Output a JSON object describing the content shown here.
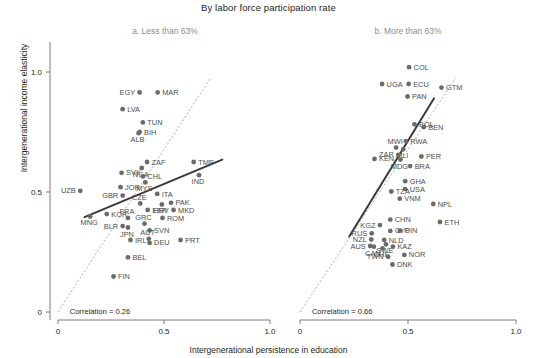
{
  "chart_data": {
    "type": "scatter",
    "title": "By labor force participation rate",
    "xlabel": "Intergenerational persistence in education",
    "ylabel": "Intergenerational income elasticity",
    "xlim": [
      0,
      1.0
    ],
    "ylim": [
      0,
      1.15
    ],
    "xticks": [
      "0",
      "0.5",
      "1.0"
    ],
    "xtick_values": [
      0,
      0.5,
      1.0
    ],
    "yticks": [
      "0",
      "0.5",
      "1.0"
    ],
    "ytick_values": [
      0,
      0.5,
      1.0
    ],
    "grid": false,
    "legend": "none",
    "reference_line": "45-degree dashed identity line",
    "panels": [
      {
        "key": "a",
        "title": "a. Less than 63%",
        "annotation": "Correlation = 0.26",
        "fit_line": {
          "x0": 0.125,
          "y0": 0.395,
          "x1": 0.775,
          "y1": 0.635
        },
        "points": [
          {
            "label": "UZB",
            "x": 0.105,
            "y": 0.505,
            "lpos": "left"
          },
          {
            "label": "LVA",
            "x": 0.305,
            "y": 0.845,
            "lpos": "right"
          },
          {
            "label": "EGY",
            "x": 0.385,
            "y": 0.915,
            "lpos": "left"
          },
          {
            "label": "MAR",
            "x": 0.47,
            "y": 0.915,
            "lpos": "right"
          },
          {
            "label": "TUN",
            "x": 0.4,
            "y": 0.79,
            "lpos": "right"
          },
          {
            "label": "BIH",
            "x": 0.385,
            "y": 0.75,
            "lpos": "right"
          },
          {
            "label": "ALB",
            "x": 0.38,
            "y": 0.745,
            "lpos": "below"
          },
          {
            "label": "ZAF",
            "x": 0.42,
            "y": 0.625,
            "lpos": "right"
          },
          {
            "label": "NGA",
            "x": 0.395,
            "y": 0.6,
            "lpos": "below"
          },
          {
            "label": "TMP",
            "x": 0.64,
            "y": 0.625,
            "lpos": "right"
          },
          {
            "label": "SVK",
            "x": 0.3,
            "y": 0.58,
            "lpos": "right"
          },
          {
            "label": "CHL",
            "x": 0.4,
            "y": 0.565,
            "lpos": "right"
          },
          {
            "label": "MYS",
            "x": 0.412,
            "y": 0.54,
            "lpos": "below"
          },
          {
            "label": "IND",
            "x": 0.665,
            "y": 0.57,
            "lpos": "below"
          },
          {
            "label": "JOR",
            "x": 0.295,
            "y": 0.52,
            "lpos": "right"
          },
          {
            "label": "GBR",
            "x": 0.305,
            "y": 0.485,
            "lpos": "left"
          },
          {
            "label": "ITA",
            "x": 0.468,
            "y": 0.492,
            "lpos": "right"
          },
          {
            "label": "CZE",
            "x": 0.388,
            "y": 0.452,
            "lpos": "above"
          },
          {
            "label": "HRV",
            "x": 0.49,
            "y": 0.448,
            "lpos": "below"
          },
          {
            "label": "PAK",
            "x": 0.533,
            "y": 0.455,
            "lpos": "right"
          },
          {
            "label": "MKD",
            "x": 0.545,
            "y": 0.425,
            "lpos": "right"
          },
          {
            "label": "ESP",
            "x": 0.423,
            "y": 0.425,
            "lpos": "right"
          },
          {
            "label": "KOR",
            "x": 0.23,
            "y": 0.408,
            "lpos": "right"
          },
          {
            "label": "MNG",
            "x": 0.152,
            "y": 0.398,
            "lpos": "below"
          },
          {
            "label": "FRA",
            "x": 0.33,
            "y": 0.392,
            "lpos": "above"
          },
          {
            "label": "ROM",
            "x": 0.493,
            "y": 0.392,
            "lpos": "right"
          },
          {
            "label": "BLR",
            "x": 0.305,
            "y": 0.358,
            "lpos": "left"
          },
          {
            "label": "JPN",
            "x": 0.33,
            "y": 0.352,
            "lpos": "below"
          },
          {
            "label": "GRC",
            "x": 0.408,
            "y": 0.368,
            "lpos": "above"
          },
          {
            "label": "SVN",
            "x": 0.432,
            "y": 0.34,
            "lpos": "right"
          },
          {
            "label": "AUT",
            "x": 0.428,
            "y": 0.305,
            "lpos": "above"
          },
          {
            "label": "DEU",
            "x": 0.432,
            "y": 0.288,
            "lpos": "right"
          },
          {
            "label": "IRL",
            "x": 0.342,
            "y": 0.3,
            "lpos": "right"
          },
          {
            "label": "PRT",
            "x": 0.578,
            "y": 0.3,
            "lpos": "right"
          },
          {
            "label": "BEL",
            "x": 0.33,
            "y": 0.228,
            "lpos": "right"
          },
          {
            "label": "FIN",
            "x": 0.262,
            "y": 0.148,
            "lpos": "right"
          }
        ]
      },
      {
        "key": "b",
        "title": "b. More than 63%",
        "annotation": "Correlation = 0.66",
        "fit_line": {
          "x0": 0.228,
          "y0": 0.315,
          "x1": 0.62,
          "y1": 0.89
        },
        "points": [
          {
            "label": "COL",
            "x": 0.505,
            "y": 1.02,
            "lpos": "right"
          },
          {
            "label": "UGA",
            "x": 0.38,
            "y": 0.95,
            "lpos": "right"
          },
          {
            "label": "ECU",
            "x": 0.503,
            "y": 0.95,
            "lpos": "right"
          },
          {
            "label": "GTM",
            "x": 0.655,
            "y": 0.935,
            "lpos": "right"
          },
          {
            "label": "PAN",
            "x": 0.498,
            "y": 0.898,
            "lpos": "right"
          },
          {
            "label": "BOL",
            "x": 0.53,
            "y": 0.782,
            "lpos": "right"
          },
          {
            "label": "BEN",
            "x": 0.573,
            "y": 0.77,
            "lpos": "right"
          },
          {
            "label": "RWA",
            "x": 0.49,
            "y": 0.712,
            "lpos": "right"
          },
          {
            "label": "MWI",
            "x": 0.445,
            "y": 0.685,
            "lpos": "above"
          },
          {
            "label": "MLI",
            "x": 0.478,
            "y": 0.678,
            "lpos": "below"
          },
          {
            "label": "ZAR",
            "x": 0.455,
            "y": 0.655,
            "lpos": "left"
          },
          {
            "label": "MDG",
            "x": 0.465,
            "y": 0.635,
            "lpos": "below"
          },
          {
            "label": "PER",
            "x": 0.562,
            "y": 0.648,
            "lpos": "right"
          },
          {
            "label": "KEN",
            "x": 0.345,
            "y": 0.638,
            "lpos": "right"
          },
          {
            "label": "BRA",
            "x": 0.51,
            "y": 0.608,
            "lpos": "right"
          },
          {
            "label": "GHA",
            "x": 0.487,
            "y": 0.545,
            "lpos": "right"
          },
          {
            "label": "USA",
            "x": 0.487,
            "y": 0.512,
            "lpos": "right"
          },
          {
            "label": "TZA",
            "x": 0.423,
            "y": 0.502,
            "lpos": "right"
          },
          {
            "label": "VNM",
            "x": 0.462,
            "y": 0.472,
            "lpos": "right"
          },
          {
            "label": "NPL",
            "x": 0.617,
            "y": 0.45,
            "lpos": "right"
          },
          {
            "label": "CHN",
            "x": 0.418,
            "y": 0.385,
            "lpos": "right"
          },
          {
            "label": "ETH",
            "x": 0.648,
            "y": 0.375,
            "lpos": "right"
          },
          {
            "label": "KGZ",
            "x": 0.37,
            "y": 0.362,
            "lpos": "left"
          },
          {
            "label": "CYP",
            "x": 0.418,
            "y": 0.338,
            "lpos": "right"
          },
          {
            "label": "GIN",
            "x": 0.462,
            "y": 0.338,
            "lpos": "right"
          },
          {
            "label": "RUS",
            "x": 0.332,
            "y": 0.328,
            "lpos": "left"
          },
          {
            "label": "NLD",
            "x": 0.39,
            "y": 0.3,
            "lpos": "right"
          },
          {
            "label": "NZL",
            "x": 0.33,
            "y": 0.302,
            "lpos": "left"
          },
          {
            "label": "SWE",
            "x": 0.398,
            "y": 0.282,
            "lpos": "below"
          },
          {
            "label": "AUS",
            "x": 0.325,
            "y": 0.275,
            "lpos": "left"
          },
          {
            "label": "CAN",
            "x": 0.342,
            "y": 0.272,
            "lpos": "below"
          },
          {
            "label": "CHE",
            "x": 0.382,
            "y": 0.265,
            "lpos": "below"
          },
          {
            "label": "KAZ",
            "x": 0.43,
            "y": 0.272,
            "lpos": "right"
          },
          {
            "label": "NOR",
            "x": 0.483,
            "y": 0.238,
            "lpos": "right"
          },
          {
            "label": "TWN",
            "x": 0.408,
            "y": 0.23,
            "lpos": "left"
          },
          {
            "label": "DNK",
            "x": 0.428,
            "y": 0.198,
            "lpos": "right"
          }
        ]
      }
    ]
  }
}
